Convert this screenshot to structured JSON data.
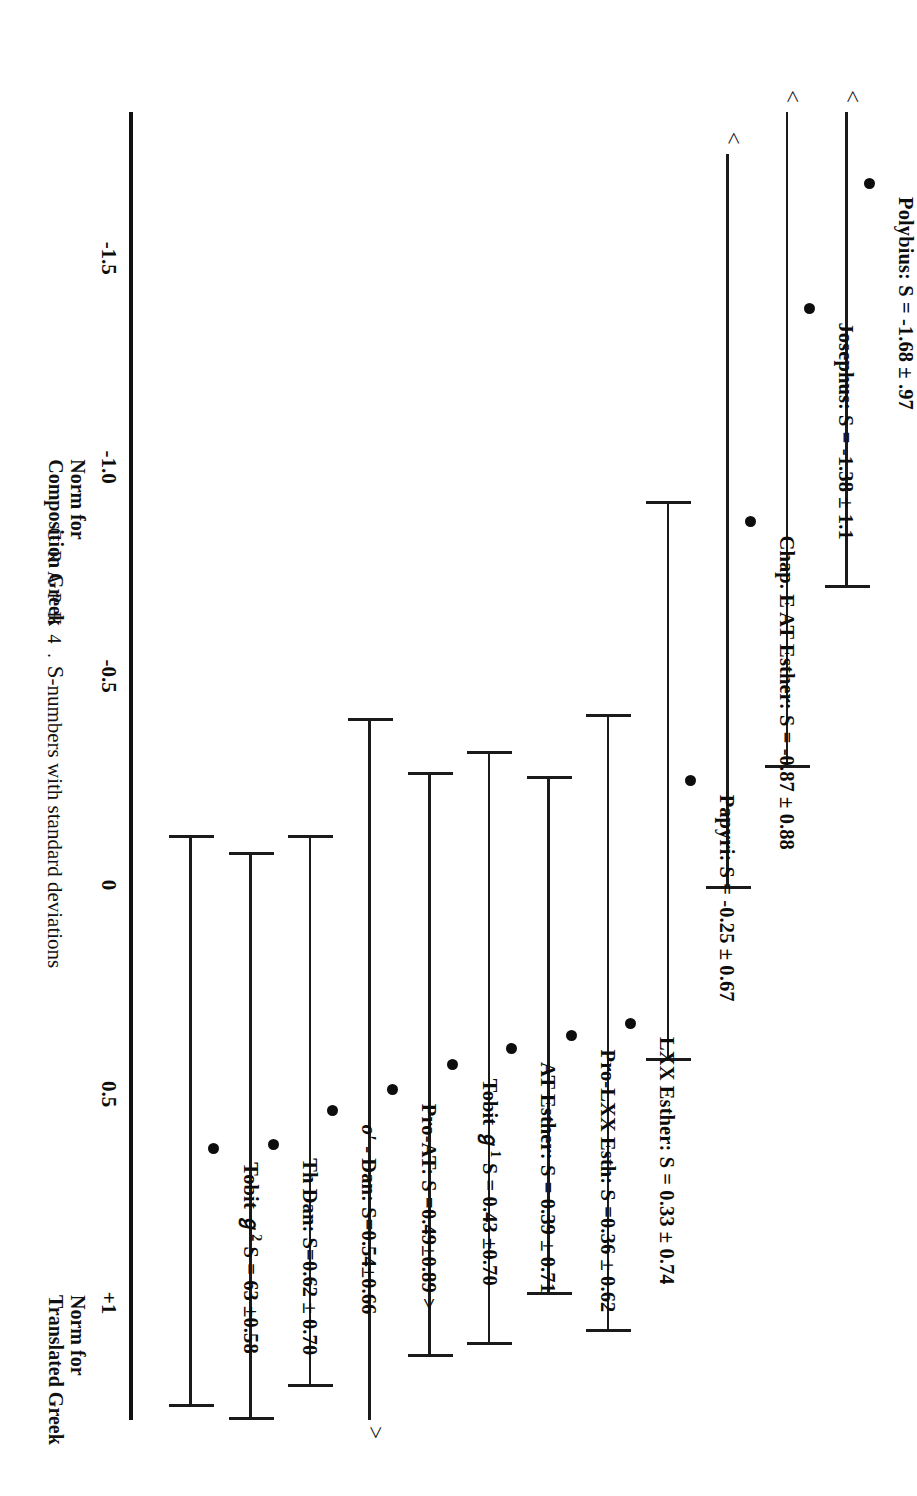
{
  "caption": {
    "head": "G R A P H  4 .",
    "body_lead": "S",
    "body_rest": "-numbers with standard deviations"
  },
  "axis": {
    "ticks": [
      {
        "label": "-1.5",
        "value": -1.5
      },
      {
        "label": "-1.0",
        "value": -1.0
      },
      {
        "label": "-0.5",
        "value": -0.5
      },
      {
        "label": "0",
        "value": 0.0
      },
      {
        "label": "0.5",
        "value": 0.5
      },
      {
        "label": "+1",
        "value": 1.0
      }
    ],
    "notes": [
      {
        "text": "Norm for\nComposition Greek",
        "value": -1.0
      },
      {
        "text": "Norm for\nTranslated Greek",
        "value": 1.0
      }
    ],
    "min": -1.85,
    "max": 1.28
  },
  "chart_data": {
    "type": "scatter",
    "title": "S-numbers with standard deviations",
    "xlabel": "S-number",
    "ylabel": "",
    "xlim": [
      -1.85,
      1.28
    ],
    "grid": false,
    "legend": "none",
    "orientation": "rotated-90",
    "series": [
      {
        "name": "Polybius",
        "label": "Polybius: S = -1.68 ± .97",
        "mean": -1.68,
        "sd": 0.97,
        "low": -2.65,
        "high": -0.71,
        "low_offscale": true,
        "high_offscale": false,
        "offscale_marker": "<"
      },
      {
        "name": "Josephus",
        "label": "Josephus: S = -1.38 ± 1.1",
        "mean": -1.38,
        "sd": 1.1,
        "low": -2.48,
        "high": -0.28,
        "low_offscale": true,
        "high_offscale": false,
        "offscale_marker": "<"
      },
      {
        "name": "Chap. E AT Esther",
        "label": "Chap. E AT Esther: S = -0.87 ± 0.88",
        "mean": -0.87,
        "sd": 0.88,
        "low": -1.75,
        "high": 0.01,
        "low_offscale": true,
        "high_offscale": false,
        "offscale_marker": "<"
      },
      {
        "name": "Papyri",
        "label": "Papyri: S = -0.25 ± 0.67",
        "mean": -0.25,
        "sd": 0.67,
        "low": -0.92,
        "high": 0.42,
        "low_offscale": false,
        "high_offscale": false,
        "offscale_marker": ""
      },
      {
        "name": "LXX Esther",
        "label": "LXX Esther: S = 0.33 ± 0.74",
        "mean": 0.33,
        "sd": 0.74,
        "low": -0.41,
        "high": 1.07,
        "low_offscale": false,
        "high_offscale": false,
        "offscale_marker": ""
      },
      {
        "name": "Pro-LXX Esth",
        "label": "Pro-LXX Esth: S =0.36 ± 0.62",
        "mean": 0.36,
        "sd": 0.62,
        "low": -0.26,
        "high": 0.98,
        "low_offscale": false,
        "high_offscale": false,
        "offscale_marker": ""
      },
      {
        "name": "AT Esther",
        "label": "AT Esther: S = 0.39 ± 0.71",
        "mean": 0.39,
        "sd": 0.71,
        "low": -0.32,
        "high": 1.1,
        "low_offscale": false,
        "high_offscale": false,
        "offscale_marker": ""
      },
      {
        "name": "Tobit a1",
        "label_pre": "Tobit ℊ",
        "label_sup": "1",
        "label_post": " S = 0.43 ±0.70",
        "label": "Tobit ℊ1 S = 0.43 ±0.70",
        "mean": 0.43,
        "sd": 0.7,
        "low": -0.27,
        "high": 1.13,
        "low_offscale": false,
        "high_offscale": false,
        "offscale_marker": ""
      },
      {
        "name": "Pro-AT",
        "label": "Pro-AT: S =0.49±0.89 >",
        "mean": 0.49,
        "sd": 0.89,
        "low": -0.4,
        "high": 1.38,
        "low_offscale": false,
        "high_offscale": true,
        "offscale_marker": ">"
      },
      {
        "name": "o' Dan",
        "label_pre": "o′",
        "label_post": " - Dan: S=0.54±0.66",
        "label": "o′ - Dan: S=0.54±0.66",
        "mean": 0.54,
        "sd": 0.66,
        "low": -0.12,
        "high": 1.2,
        "low_offscale": false,
        "high_offscale": false,
        "offscale_marker": ""
      },
      {
        "name": "Th Dan",
        "label": "Th Dan: S=0.62 ± 0.70",
        "mean": 0.62,
        "sd": 0.7,
        "low": -0.08,
        "high": 1.32,
        "low_offscale": false,
        "high_offscale": false,
        "offscale_marker": ""
      },
      {
        "name": "Tobit a2",
        "label_pre": "Tobit ℊ",
        "label_sup": "2",
        "label_post": " S = 63 ±0.58",
        "label": "Tobit ℊ2 S = 63 ±0.58",
        "mean": 0.63,
        "sd": 0.58,
        "low": -0.12,
        "high": 1.25,
        "low_offscale": false,
        "high_offscale": false,
        "offscale_marker": ""
      }
    ]
  }
}
